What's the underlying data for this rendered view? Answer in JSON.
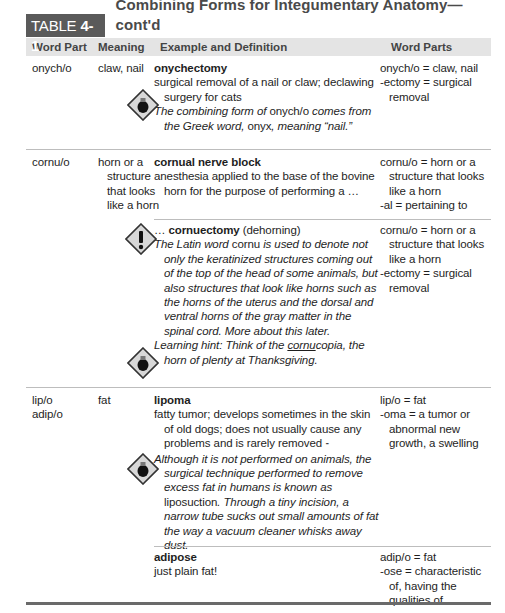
{
  "table": {
    "label_prefix": "TABLE ",
    "label_number": "4-1",
    "title": "Combining Forms for Integumentary Anatomy—cont'd",
    "headers": [
      "Word Part",
      "Meaning",
      "Example and Definition",
      "Word Parts"
    ]
  },
  "rows": [
    {
      "word_part": [
        "onych/o"
      ],
      "meaning": "claw, nail",
      "examples": [
        {
          "term": "onychectomy",
          "definition": "surgical removal of a nail or claw; declawing surgery for cats",
          "note_icon": "lightbulb-icon",
          "note_parts": [
            {
              "text": "The combining form of ",
              "italic": true
            },
            {
              "text": "onych/o",
              "italic": false
            },
            {
              "text": " comes from the Greek word, ",
              "italic": true
            },
            {
              "text": "onyx",
              "italic": false
            },
            {
              "text": ", meaning “nail.”",
              "italic": true
            }
          ],
          "word_parts": [
            "onych/o = claw, nail",
            "-ectomy = surgical removal"
          ]
        }
      ]
    },
    {
      "word_part": [
        "cornu/o"
      ],
      "meaning": "horn or a structure that looks like a horn",
      "examples": [
        {
          "term": "cornual nerve block",
          "definition": "anesthesia applied to the base of the bovine horn for the purpose of performing a …",
          "word_parts": [
            "cornu/o = horn or a structure that looks like a horn",
            "-al = pertaining to"
          ]
        },
        {
          "term_prefix": "… ",
          "term": "cornuectomy",
          "term_suffix": " (dehorning)",
          "warning_icon": "exclamation-warning-icon",
          "note_parts": [
            {
              "text": "The Latin word ",
              "italic": true
            },
            {
              "text": "cornu",
              "italic": false
            },
            {
              "text": " is used to denote not only the keratinized structures coming out of the top of the head of some animals, but also structures that look like horns such as the horns of the uterus and the dorsal and ventral horns of the gray matter in the spinal cord. More about this later.",
              "italic": true
            }
          ],
          "hint_icon": "lightbulb-icon",
          "hint_prefix": "Learning hint: Think of the ",
          "hint_underlined": "cornu",
          "hint_rest": "copia, the horn of plenty at Thanksgiving.",
          "word_parts": [
            "cornu/o = horn or a structure that looks like a horn",
            "-ectomy = surgical removal"
          ]
        }
      ]
    },
    {
      "word_part": [
        "lip/o",
        "adip/o"
      ],
      "meaning": "fat",
      "examples": [
        {
          "term": "lipoma",
          "definition": "fatty tumor; develops sometimes in the skin of old dogs; does not usually cause any problems and is rarely removed",
          "definition_mark": "⁃",
          "note_icon": "lightbulb-icon",
          "note_parts": [
            {
              "text": "Although it is not performed on animals, the surgical technique performed to remove excess fat in humans is known as ",
              "italic": true
            },
            {
              "text": "liposuction",
              "italic": false
            },
            {
              "text": ". Through a tiny incision, a narrow tube sucks out small amounts of fat the way a vacuum cleaner whisks away dust.",
              "italic": true
            }
          ],
          "word_parts": [
            "lip/o = fat",
            "-oma = a tumor or abnormal new growth, a swelling"
          ]
        },
        {
          "term": "adipose",
          "definition": "just plain fat!",
          "word_parts": [
            "adip/o = fat",
            "-ose = characteristic of, having the qualities of"
          ]
        }
      ]
    }
  ]
}
